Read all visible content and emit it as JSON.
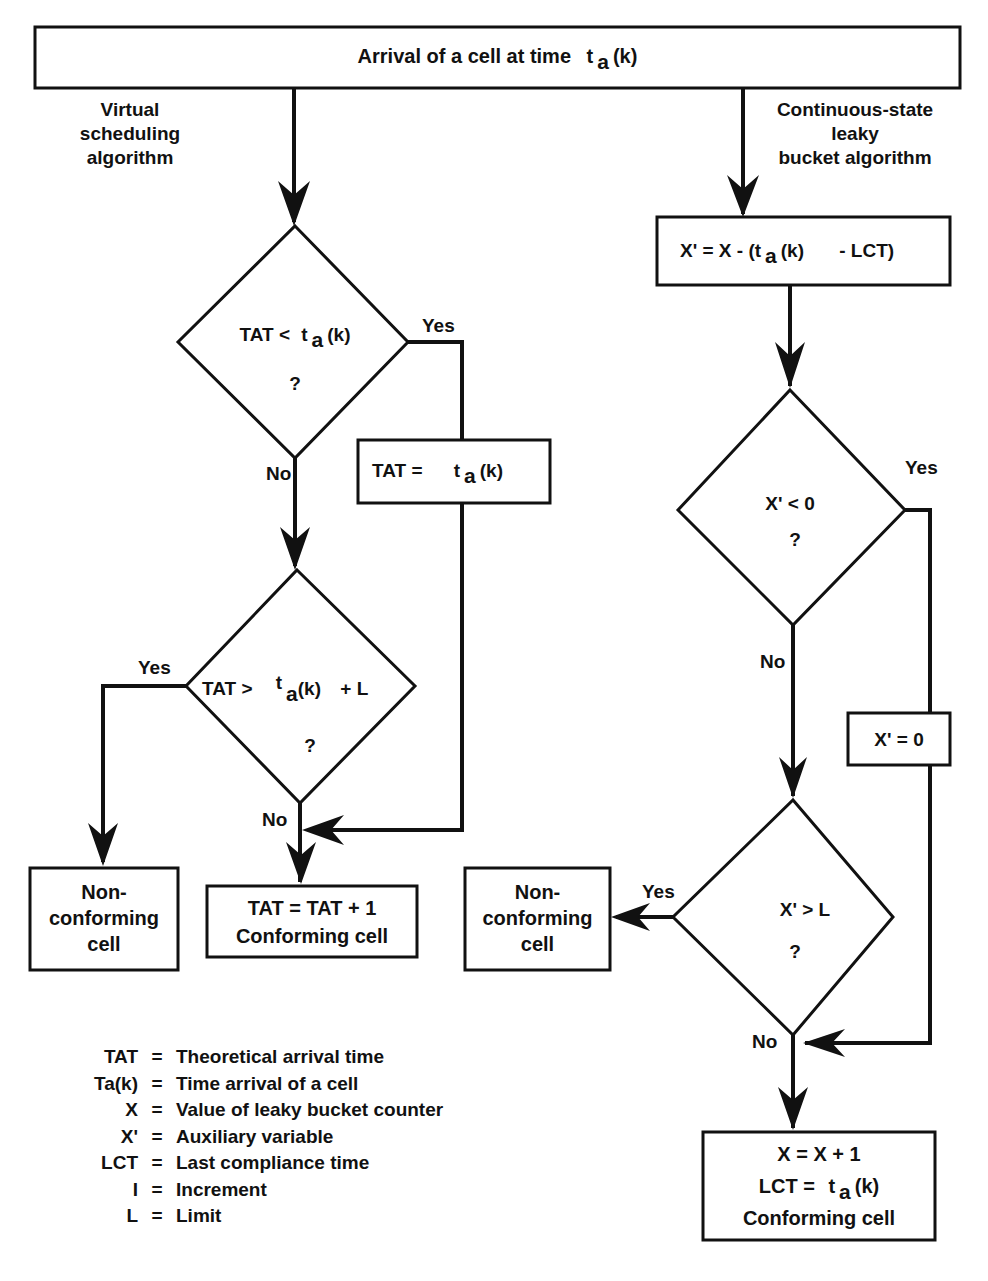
{
  "title": {
    "prefix": "Arrival of a cell at time",
    "var": "t",
    "sub": "a",
    "suffix": "(k)"
  },
  "branches": {
    "left": [
      "Virtual",
      "scheduling",
      "algorithm"
    ],
    "right": [
      "Continuous-state",
      "leaky",
      "bucket algorithm"
    ]
  },
  "left": {
    "d1": {
      "prefix": "TAT <",
      "var": "t",
      "sub": "a",
      "suffix": "(k)",
      "q": "?"
    },
    "d1_yes": "Yes",
    "d1_no": "No",
    "set_tat": {
      "prefix": "TAT =",
      "var": "t",
      "sub": "a",
      "suffix": "(k)"
    },
    "d2": {
      "prefix": "TAT >",
      "var": "t",
      "sub": "a",
      "suffix": "(k)",
      "plus": "+ L",
      "q": "?"
    },
    "d2_yes": "Yes",
    "d2_no": "No",
    "nonconf": [
      "Non-",
      "conforming",
      "cell"
    ],
    "conf": [
      "TAT = TAT + 1",
      "Conforming cell"
    ]
  },
  "right": {
    "calc": {
      "prefix": "X' = X - (t",
      "sub": "a",
      "suffix": "(k)",
      "tail": "- LCT)"
    },
    "d3": {
      "text": "X' < 0",
      "q": "?"
    },
    "d3_yes": "Yes",
    "d3_no": "No",
    "zero": "X' = 0",
    "d4": {
      "text": "X' > L",
      "q": "?"
    },
    "d4_yes": "Yes",
    "d4_no": "No",
    "nonconf": [
      "Non-",
      "conforming",
      "cell"
    ],
    "conf": {
      "line1": "X = X + 1",
      "line2_prefix": "LCT =",
      "var": "t",
      "sub": "a",
      "suffix": "(k)",
      "line3": "Conforming cell"
    }
  },
  "legend": [
    {
      "term": "TAT",
      "desc": "Theoretical arrival time"
    },
    {
      "term": "Ta(k)",
      "desc": "Time arrival of a cell"
    },
    {
      "term": "X",
      "desc": "Value of leaky bucket counter"
    },
    {
      "term": "X'",
      "desc": "Auxiliary variable"
    },
    {
      "term": "LCT",
      "desc": "Last compliance time"
    },
    {
      "term": "I",
      "desc": "Increment"
    },
    {
      "term": "L",
      "desc": "Limit"
    }
  ]
}
